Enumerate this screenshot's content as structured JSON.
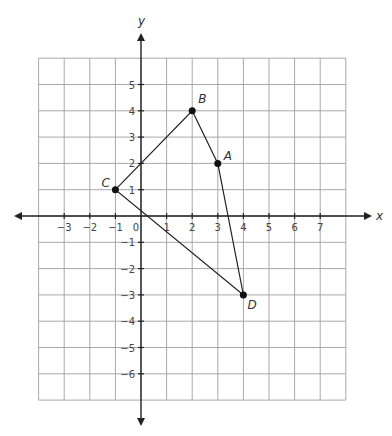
{
  "chart_data": {
    "type": "scatter",
    "title": "",
    "xlabel": "x",
    "ylabel": "y",
    "xlim": [
      -4,
      8
    ],
    "ylim": [
      -7,
      6
    ],
    "grid": true,
    "x_tick_labels": [
      "−3",
      "−2",
      "−1",
      "0",
      "1",
      "2",
      "3",
      "4",
      "5",
      "6",
      "7"
    ],
    "y_tick_labels": [
      "5",
      "4",
      "3",
      "2",
      "1",
      "−1",
      "−2",
      "−3",
      "−4",
      "−5",
      "−6"
    ],
    "points": [
      {
        "label": "A",
        "x": 3,
        "y": 2
      },
      {
        "label": "B",
        "x": 2,
        "y": 4
      },
      {
        "label": "C",
        "x": -1,
        "y": 1
      },
      {
        "label": "D",
        "x": 4,
        "y": -3
      }
    ],
    "polygon": [
      "C",
      "B",
      "A",
      "D"
    ],
    "series": [
      {
        "name": "quadrilateral ABDC",
        "x": [
          -1,
          2,
          3,
          4,
          -1
        ],
        "y": [
          1,
          4,
          2,
          -3,
          1
        ]
      }
    ]
  }
}
